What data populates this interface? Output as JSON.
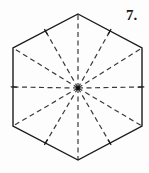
{
  "figure": {
    "number_label": "7.",
    "label_position": {
      "x": 126,
      "y": 8
    },
    "shape_name": "hexagon",
    "canvas": {
      "width": 149,
      "height": 173
    },
    "colors": {
      "background": "#fdfdfd",
      "outline": "#1a1a1a",
      "fold_line": "#3a3a3a",
      "center_point": "#111111",
      "label": "#1a1a1a"
    },
    "stroke": {
      "outline_width": 1.4,
      "fold_width": 1.2,
      "fold_dash": "5,3.5",
      "tick_width": 1.3
    },
    "center": {
      "x": 78,
      "y": 88
    },
    "center_dot_radius": 2.2,
    "vertices": [
      {
        "name": "top",
        "x": 78,
        "y": 14
      },
      {
        "name": "upper-right",
        "x": 142,
        "y": 48
      },
      {
        "name": "lower-right",
        "x": 142,
        "y": 126
      },
      {
        "name": "bottom",
        "x": 78,
        "y": 160
      },
      {
        "name": "lower-left",
        "x": 13,
        "y": 126
      },
      {
        "name": "upper-left",
        "x": 13,
        "y": 48
      }
    ],
    "edge_midpoints": [
      {
        "name": "upper-right-edge",
        "x": 110.0,
        "y": 31.0
      },
      {
        "name": "right-edge",
        "x": 142.0,
        "y": 87.0
      },
      {
        "name": "lower-right-edge",
        "x": 110.0,
        "y": 143.0
      },
      {
        "name": "lower-left-edge",
        "x": 45.5,
        "y": 143.0
      },
      {
        "name": "left-edge",
        "x": 13.0,
        "y": 87.0
      },
      {
        "name": "upper-left-edge",
        "x": 45.5,
        "y": 31.0
      }
    ],
    "fold_line_count": 12,
    "diameter_count": 6,
    "tick_mark_length": 7
  }
}
